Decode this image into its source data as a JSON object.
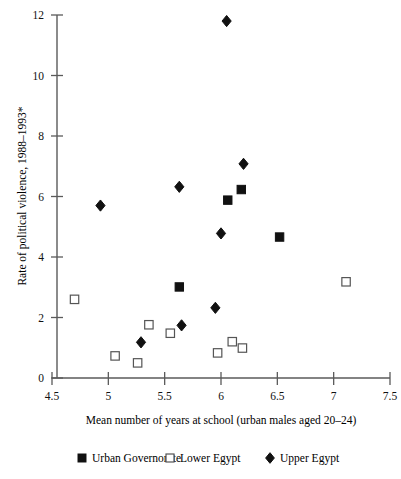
{
  "chart_data": {
    "type": "scatter",
    "title": "",
    "xlabel": "Mean number of years at school (urban males aged 20–24)",
    "ylabel": "Rate of political violence, 1988–1993*",
    "xlim": [
      4.5,
      7.5
    ],
    "ylim": [
      0,
      12
    ],
    "xticks": [
      "4.5",
      "5",
      "5.5",
      "6",
      "6.5",
      "7",
      "7.5"
    ],
    "xtick_values": [
      4.5,
      5,
      5.5,
      6,
      6.5,
      7,
      7.5
    ],
    "yticks": [
      "0",
      "2",
      "4",
      "6",
      "8",
      "10",
      "12"
    ],
    "ytick_values": [
      0,
      2,
      4,
      6,
      8,
      10,
      12
    ],
    "grid": false,
    "legend_position": "below-axes",
    "series": [
      {
        "name": "Urban Governorate",
        "marker": "filled-square",
        "color": "#111111",
        "points": [
          {
            "x": 6.06,
            "y": 5.88
          },
          {
            "x": 6.18,
            "y": 6.23
          },
          {
            "x": 5.63,
            "y": 3.01
          },
          {
            "x": 6.52,
            "y": 4.66
          }
        ]
      },
      {
        "name": "Lower Egypt",
        "marker": "open-square",
        "color": "#555555",
        "points": [
          {
            "x": 4.7,
            "y": 2.6
          },
          {
            "x": 5.06,
            "y": 0.73
          },
          {
            "x": 5.26,
            "y": 0.5
          },
          {
            "x": 5.36,
            "y": 1.76
          },
          {
            "x": 5.55,
            "y": 1.48
          },
          {
            "x": 5.97,
            "y": 0.83
          },
          {
            "x": 6.1,
            "y": 1.2
          },
          {
            "x": 6.19,
            "y": 0.99
          },
          {
            "x": 7.11,
            "y": 3.18
          }
        ]
      },
      {
        "name": "Upper Egypt",
        "marker": "filled-diamond",
        "color": "#111111",
        "points": [
          {
            "x": 6.05,
            "y": 11.8
          },
          {
            "x": 6.2,
            "y": 7.08
          },
          {
            "x": 5.63,
            "y": 6.32
          },
          {
            "x": 4.93,
            "y": 5.7
          },
          {
            "x": 6.0,
            "y": 4.78
          },
          {
            "x": 5.95,
            "y": 2.32
          },
          {
            "x": 5.65,
            "y": 1.74
          },
          {
            "x": 5.29,
            "y": 1.18
          }
        ]
      }
    ]
  },
  "legend": {
    "items": [
      {
        "label": "Urban Governorate",
        "marker": "filled-square"
      },
      {
        "label": "Lower Egypt",
        "marker": "open-square"
      },
      {
        "label": "Upper Egypt",
        "marker": "filled-diamond"
      }
    ]
  }
}
